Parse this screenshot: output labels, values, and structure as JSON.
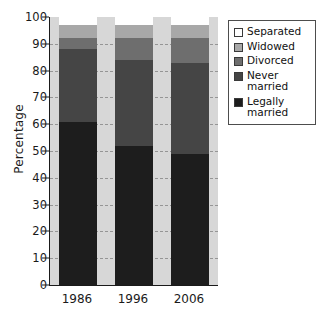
{
  "chart_data": {
    "type": "bar",
    "subtype": "stacked-bar-100",
    "title": "",
    "xlabel": "",
    "ylabel": "Percentage",
    "categories": [
      "1986",
      "1996",
      "2006"
    ],
    "ylim": [
      0,
      100
    ],
    "yticks": [
      0,
      10,
      20,
      30,
      40,
      50,
      60,
      70,
      80,
      90,
      100
    ],
    "ytick_labels": [
      "0",
      "10",
      "20",
      "30",
      "40",
      "50",
      "60",
      "70",
      "80",
      "90",
      "100"
    ],
    "grid": true,
    "legend_position": "right",
    "stack_order_bottom_to_top": [
      "Legally married",
      "Never married",
      "Divorced",
      "Widowed",
      "Separated"
    ],
    "series": [
      {
        "name": "Legally married",
        "color": "#1d1d1d",
        "values": [
          61,
          52,
          49
        ]
      },
      {
        "name": "Never married",
        "color": "#454545",
        "values": [
          27,
          32,
          34
        ]
      },
      {
        "name": "Divorced",
        "color": "#6e6e6e",
        "values": [
          4,
          8,
          9
        ]
      },
      {
        "name": "Widowed",
        "color": "#a8a8a8",
        "values": [
          5,
          5,
          5
        ]
      },
      {
        "name": "Separated",
        "color": "#ffffff",
        "values": [
          3,
          3,
          3
        ]
      }
    ]
  },
  "axis": {
    "y_title": "Percentage",
    "y_tick_labels": [
      "100",
      "90",
      "80",
      "70",
      "60",
      "50",
      "40",
      "30",
      "20",
      "10",
      "0"
    ],
    "x_tick_labels": [
      "1986",
      "1996",
      "2006"
    ]
  },
  "legend": {
    "items": [
      {
        "label": "Separated",
        "color": "#ffffff",
        "swatch": "legend-swatch-separated"
      },
      {
        "label": "Widowed",
        "color": "#a8a8a8",
        "swatch": "legend-swatch-widowed"
      },
      {
        "label": "Divorced",
        "color": "#6e6e6e",
        "swatch": "legend-swatch-divorced"
      },
      {
        "label": "Never\nmarried",
        "color": "#454545",
        "swatch": "legend-swatch-never-married"
      },
      {
        "label": "Legally\nmarried",
        "color": "#1d1d1d",
        "swatch": "legend-swatch-legally-married"
      }
    ]
  },
  "colors": {
    "plot_background": "#d7d7d7",
    "page_background": "#ffffff",
    "axis": "#1a1a1a",
    "gridline": "#8a8a8a"
  }
}
